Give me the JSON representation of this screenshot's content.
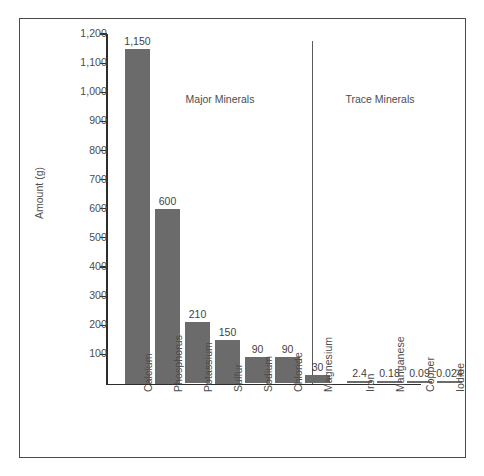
{
  "chart_data": {
    "type": "bar",
    "title": "",
    "xlabel": "",
    "ylabel": "Amount (g)",
    "ylim": [
      0,
      1200
    ],
    "ytick_step": 100,
    "grid": false,
    "legend": "none",
    "bar_color": "#6b6b6b",
    "axis_color": "#2d2d2d",
    "categories": [
      "Calcium",
      "Phosphorus",
      "Potassium",
      "Sulfur",
      "Sodium",
      "Chloride",
      "Magnesium",
      "Iron",
      "Manganese",
      "Copper",
      "Iodide"
    ],
    "values": [
      1150,
      600,
      210,
      150,
      90,
      90,
      30,
      2.4,
      0.18,
      0.09,
      0.024
    ],
    "value_labels": [
      "1,150",
      "600",
      "210",
      "150",
      "90",
      "90",
      "30",
      "2.4",
      "0.18",
      "0.09",
      "0.024"
    ],
    "ytick_labels": [
      "1,200",
      "1,100",
      "1,000",
      "900",
      "800",
      "700",
      "600",
      "500",
      "400",
      "300",
      "200",
      "100"
    ],
    "yticks": [
      1200,
      1100,
      1000,
      900,
      800,
      700,
      600,
      500,
      400,
      300,
      200,
      100
    ],
    "groups": [
      {
        "name": "Major Minerals",
        "categories": [
          "Calcium",
          "Phosphorus",
          "Potassium",
          "Sulfur",
          "Sodium",
          "Chloride",
          "Magnesium"
        ]
      },
      {
        "name": "Trace Minerals",
        "categories": [
          "Iron",
          "Manganese",
          "Copper",
          "Iodide"
        ]
      }
    ],
    "annotations": [
      "Major Minerals",
      "Trace Minerals"
    ]
  }
}
